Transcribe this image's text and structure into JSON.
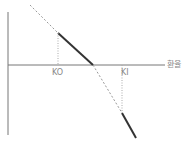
{
  "diagram": {
    "x_axis_label": "환율",
    "markers": [
      {
        "label": "KO"
      },
      {
        "label": "KI"
      }
    ],
    "colors": {
      "axis": "#666666",
      "solid": "#333333",
      "dashed": "#999999"
    }
  }
}
